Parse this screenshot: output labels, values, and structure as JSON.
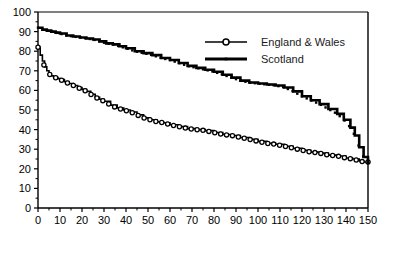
{
  "chart_data": {
    "type": "line",
    "title": "",
    "subtitle": "",
    "xlabel": "",
    "ylabel": "",
    "xlim": [
      0,
      150
    ],
    "ylim": [
      0,
      100
    ],
    "xticks": [
      0,
      10,
      20,
      30,
      40,
      50,
      60,
      70,
      80,
      90,
      100,
      110,
      120,
      130,
      140,
      150
    ],
    "yticks": [
      0,
      10,
      20,
      30,
      40,
      50,
      60,
      70,
      80,
      90,
      100
    ],
    "xtick_labels": [
      "0",
      "10",
      "20",
      "30",
      "40",
      "50",
      "60",
      "70",
      "80",
      "90",
      "100",
      "110",
      "120",
      "130",
      "140",
      "150"
    ],
    "ytick_labels": [
      "0",
      "10",
      "20",
      "30",
      "40",
      "50",
      "60",
      "70",
      "80",
      "90",
      "100"
    ],
    "minor_tick_step": 5,
    "grid": false,
    "legend_position": "top-right",
    "series": [
      {
        "name": "England & Wales",
        "marker": "open-circle",
        "color": "#000000",
        "x": [
          0,
          1,
          2,
          3,
          4,
          5,
          6,
          7,
          8,
          9,
          10,
          12,
          14,
          16,
          18,
          20,
          22,
          24,
          26,
          28,
          30,
          33,
          36,
          39,
          42,
          45,
          48,
          51,
          54,
          57,
          60,
          64,
          68,
          72,
          76,
          80,
          84,
          88,
          92,
          96,
          100,
          104,
          108,
          112,
          116,
          120,
          124,
          128,
          132,
          136,
          140,
          143,
          146,
          148,
          150
        ],
        "values": [
          82,
          78,
          75,
          72,
          70,
          68.5,
          67.5,
          67,
          66.5,
          66,
          65.5,
          64.5,
          63.5,
          62.5,
          61.5,
          60.5,
          59.5,
          58,
          56.5,
          55.5,
          54.5,
          52.5,
          51,
          50,
          49,
          47.5,
          46,
          45,
          44,
          43.5,
          42.5,
          41.5,
          40.5,
          40,
          39.5,
          38.5,
          37.5,
          37,
          36,
          35,
          34,
          33,
          32.5,
          31.5,
          30.5,
          29.5,
          28.5,
          28,
          27,
          26.5,
          25.5,
          25,
          24,
          23.5,
          23.5
        ]
      },
      {
        "name": "Scotland",
        "marker": "plus-line",
        "color": "#000000",
        "x": [
          0,
          2,
          4,
          6,
          8,
          10,
          13,
          16,
          19,
          22,
          25,
          28,
          31,
          34,
          37,
          40,
          44,
          48,
          52,
          56,
          60,
          64,
          68,
          72,
          76,
          80,
          84,
          88,
          92,
          96,
          100,
          104,
          108,
          112,
          116,
          120,
          124,
          128,
          132,
          136,
          139,
          142,
          144,
          146,
          148,
          150
        ],
        "values": [
          92,
          91,
          90.5,
          90,
          89.5,
          89,
          88,
          87.5,
          87,
          86.5,
          86,
          85,
          84,
          83.5,
          82.5,
          81.5,
          80,
          79,
          78,
          76.5,
          75.5,
          74,
          72.5,
          71.5,
          70.5,
          69.5,
          68,
          66.5,
          65,
          64,
          63.5,
          63,
          62.5,
          61.5,
          59.5,
          57,
          55,
          53,
          50.5,
          48,
          45,
          41,
          37,
          31,
          26,
          23
        ]
      }
    ]
  },
  "legend": {
    "entries": [
      {
        "label": "England & Wales",
        "marker": "open-circle"
      },
      {
        "label": "Scotland",
        "marker": "plus-line"
      }
    ]
  },
  "colors": {
    "axis": "#000000",
    "series_primary": "#000000",
    "series_secondary": "#000000",
    "background": "#ffffff"
  }
}
